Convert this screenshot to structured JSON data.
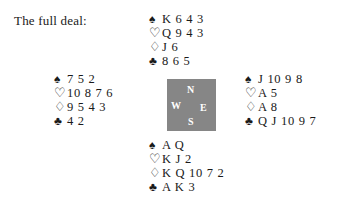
{
  "caption": "The full deal:",
  "suits": {
    "spade": {
      "name": "spade-icon",
      "glyph": "♠",
      "style": "solid"
    },
    "heart": {
      "name": "heart-icon",
      "glyph": "♡",
      "style": "outline"
    },
    "diamond": {
      "name": "diamond-icon",
      "glyph": "♢",
      "style": "outline"
    },
    "club": {
      "name": "club-icon",
      "glyph": "♣",
      "style": "solid"
    }
  },
  "compass": {
    "background_color": "#868686",
    "text_color": "#ffffff",
    "north": "N",
    "west": "W",
    "east": "E",
    "south": "S"
  },
  "hands": {
    "north": {
      "position": "North",
      "spades": "K 6 4 3",
      "hearts": "Q 9 4 3",
      "diamonds": "J 6",
      "clubs": "8 6 5"
    },
    "west": {
      "position": "West",
      "spades": "7 5 2",
      "hearts": "10 8 7 6",
      "diamonds": "9 5 4 3",
      "clubs": "4 2"
    },
    "east": {
      "position": "East",
      "spades": "J 10 9 8",
      "hearts": "A 5",
      "diamonds": "A 8",
      "clubs": "Q J 10 9 7"
    },
    "south": {
      "position": "South",
      "spades": "A Q",
      "hearts": "K J 2",
      "diamonds": "K Q 10 7 2",
      "clubs": "A K 3"
    }
  }
}
